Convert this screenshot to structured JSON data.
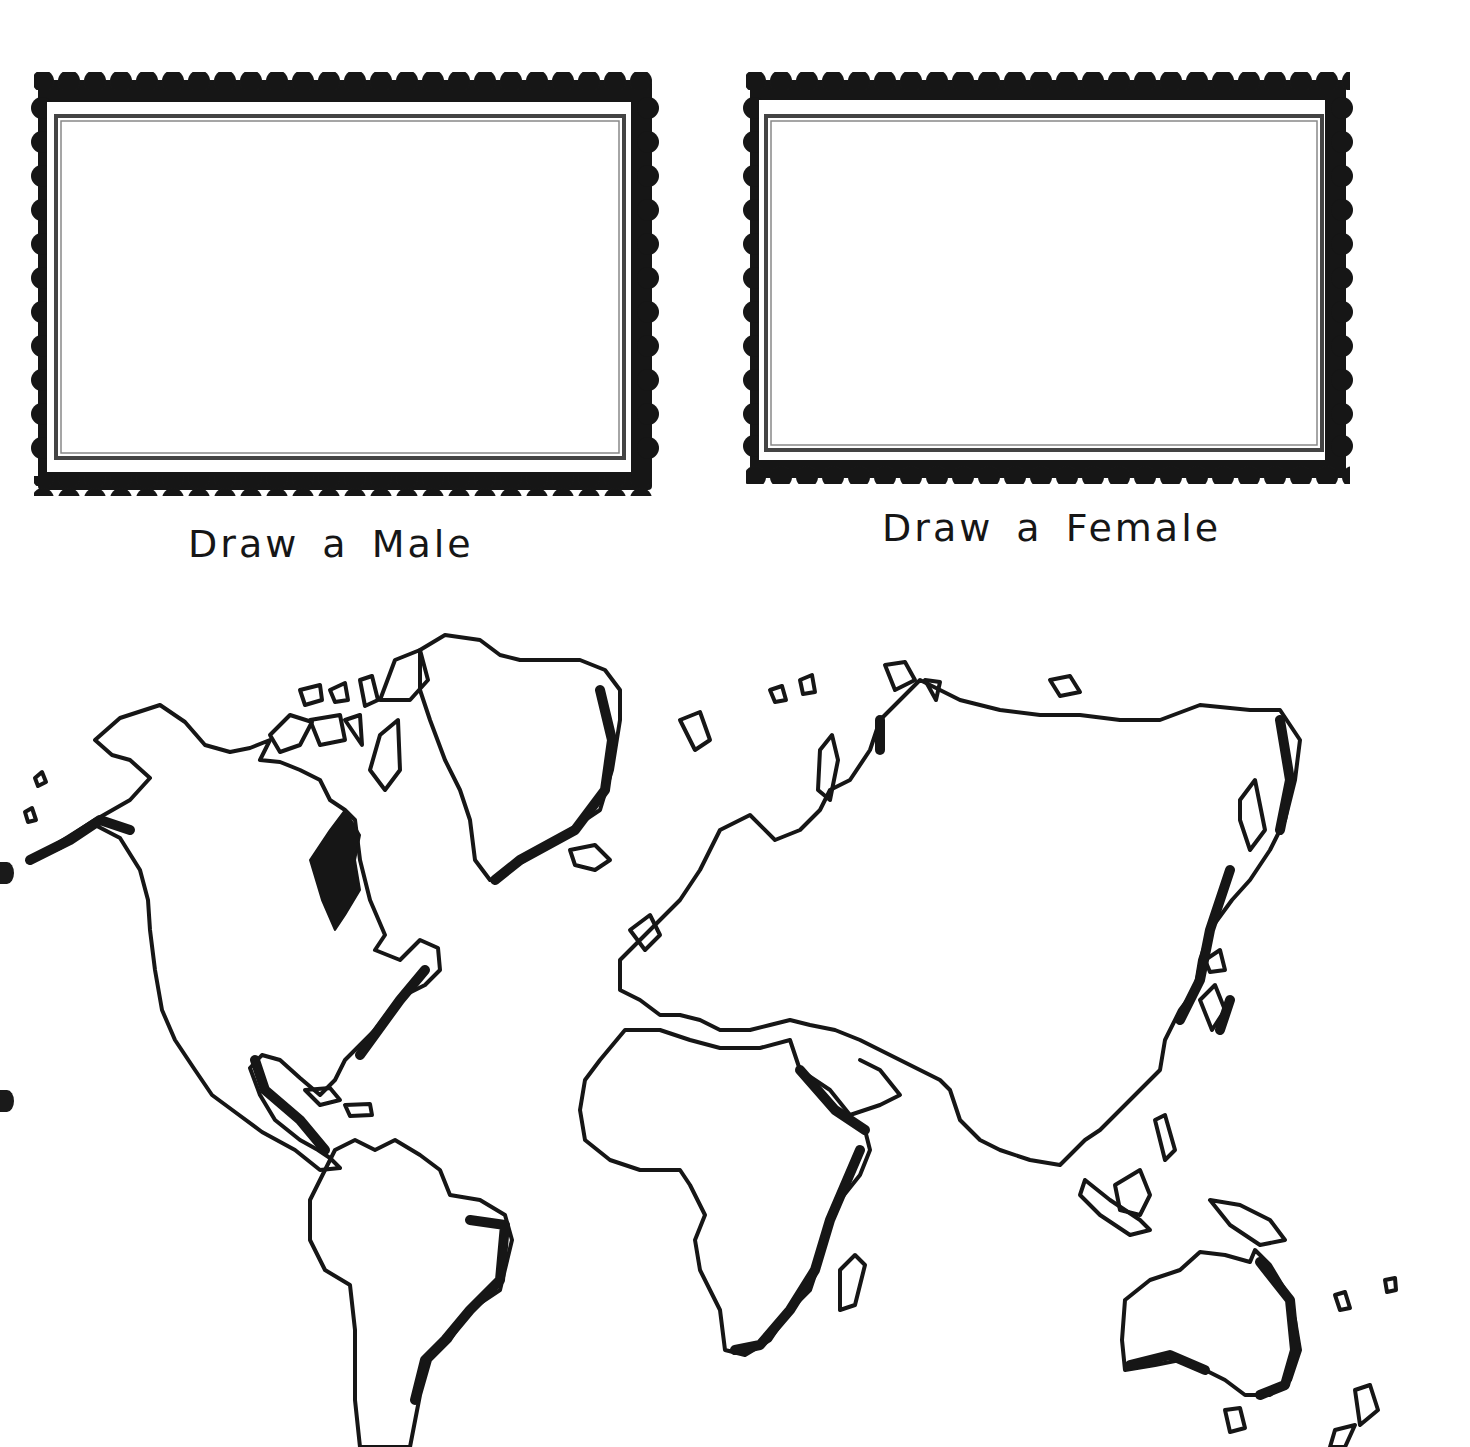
{
  "worksheet": {
    "frames": [
      {
        "id": "male",
        "caption": "Draw a Male"
      },
      {
        "id": "female",
        "caption": "Draw a Female"
      }
    ],
    "map": {
      "label": "World map outline",
      "continents": [
        "North America",
        "South America",
        "Europe",
        "Africa",
        "Asia",
        "Australia",
        "Greenland"
      ]
    },
    "colors": {
      "ink": "#161616",
      "paper": "#ffffff",
      "inner_border": "#555555"
    }
  }
}
